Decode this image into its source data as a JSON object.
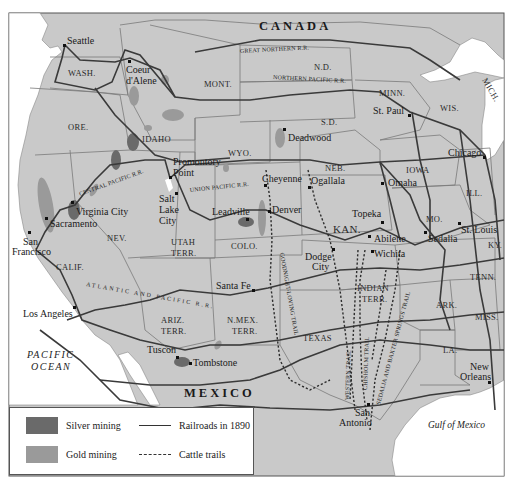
{
  "map": {
    "type": "historical thematic map",
    "subject": "Western United States mining, railroads and cattle trails",
    "colors": {
      "land": "#c9c9c9",
      "water": "#ffffff",
      "border": "#777777",
      "railroad": "#3a3a3a",
      "silver": "#6a6a6a",
      "gold": "#9a9a9a",
      "frame": "#555555"
    },
    "countries": [
      {
        "label": "CANADA"
      },
      {
        "label": "MEXICO"
      }
    ],
    "water_bodies": [
      {
        "label_line1": "PACIFIC",
        "label_line2": "OCEAN"
      },
      {
        "label": "Gulf of Mexico"
      }
    ],
    "states": [
      "WASH.",
      "ORE.",
      "IDAHO",
      "MONT.",
      "WYO.",
      "N.D.",
      "S.D.",
      "NEB.",
      "MINN.",
      "WIS.",
      "MICH.",
      "IOWA",
      "ILL.",
      "MO.",
      "KAN.",
      "KY.",
      "TENN.",
      "ARK.",
      "MISS.",
      "LA.",
      "TEXAS",
      "COLO.",
      "NEV.",
      "CALIF.",
      "ARIZ.",
      "TERR.",
      "N.MEX.",
      "TERR.",
      "UTAH",
      "TERR.",
      "INDIAN",
      "TERR."
    ],
    "cities": [
      "Seattle",
      "Coeur",
      "d'Alene",
      "St. Paul",
      "Deadwood",
      "Chicago",
      "Promontory",
      "Point",
      "Salt",
      "Lake",
      "City",
      "Cheyenne",
      "Ogallala",
      "Omaha",
      "Virginia City",
      "Sacramento",
      "San",
      "Francisco",
      "Leadville",
      "Denver",
      "Topeka",
      "Abilene",
      "St. Louis",
      "Sedalia",
      "Wichita",
      "Dodge",
      "City",
      "Santa Fe",
      "Los Angeles",
      "Tuscon",
      "Tombstone",
      "New",
      "Orleans",
      "San",
      "Antonio"
    ],
    "railroads": [
      "GREAT NORTHERN R.R.",
      "NORTHERN PACIFIC R.R.",
      "CENTRAL PACIFIC R.R.",
      "UNION PACIFIC R.R.",
      "ATLANTIC AND PACIFIC R.R."
    ],
    "trails": [
      "GOODNIGHT-LOVING TRAIL",
      "WESTERN TRAIL",
      "CHISHOLM TRAIL",
      "SEDALIA AND BAXTER SPRINGS TRAIL"
    ]
  },
  "labels": {
    "canada": "CANADA",
    "mexico": "MEXICO",
    "pacific1": "PACIFIC",
    "pacific2": "OCEAN",
    "gulf": "Gulf of Mexico",
    "wash": "WASH.",
    "ore": "ORE.",
    "idaho": "IDAHO",
    "mont": "MONT.",
    "wyo": "WYO.",
    "nd": "N.D.",
    "sd": "S.D.",
    "neb": "NEB.",
    "minn": "MINN.",
    "wis": "WIS.",
    "mich": "MICH.",
    "iowa": "IOWA",
    "ill": "ILL.",
    "mo": "MO.",
    "kan": "KAN.",
    "ky": "KY.",
    "tenn": "TENN.",
    "ark": "ARK.",
    "miss": "MISS.",
    "la": "LA.",
    "texas": "TEXAS",
    "colo": "COLO.",
    "nev": "NEV.",
    "calif": "CALIF.",
    "ariz1": "ARIZ.",
    "ariz2": "TERR.",
    "nmex1": "N.MEX.",
    "nmex2": "TERR.",
    "utah1": "UTAH",
    "utah2": "TERR.",
    "indian1": "INDIAN",
    "indian2": "TERR.",
    "seattle": "Seattle",
    "coeur1": "Coeur",
    "coeur2": "d'Alene",
    "stpaul": "St. Paul",
    "deadwood": "Deadwood",
    "chicago": "Chicago",
    "promontory1": "Promontory",
    "promontory2": "Point",
    "slc1": "Salt",
    "slc2": "Lake",
    "slc3": "City",
    "cheyenne": "Cheyenne",
    "ogallala": "Ogallala",
    "omaha": "Omaha",
    "virginia": "Virginia City",
    "sacramento": "Sacramento",
    "sf1": "San",
    "sf2": "Francisco",
    "leadville": "Leadville",
    "denver": "Denver",
    "topeka": "Topeka",
    "abilene": "Abilene",
    "stlouis": "St. Louis",
    "sedalia": "Sedalia",
    "wichita": "Wichita",
    "dodge1": "Dodge",
    "dodge2": "City",
    "santafe": "Santa Fe",
    "la_city": "Los Angeles",
    "tuscon": "Tuscon",
    "tombstone": "Tombstone",
    "no1": "New",
    "no2": "Orleans",
    "sa1": "San",
    "sa2": "Antonio",
    "rr_gn": "GREAT NORTHERN R.R.",
    "rr_np": "NORTHERN PACIFIC R.R.",
    "rr_cp": "CENTRAL PACIFIC R.R.",
    "rr_up": "UNION PACIFIC R.R.",
    "rr_ap": "ATLANTIC AND PACIFIC R.R.",
    "tr_gl": "GOODNIGHT-LOVING TRAIL",
    "tr_w": "WESTERN TRAIL",
    "tr_c": "CHISHOLM TRAIL",
    "tr_s": "SEDALIA AND BAXTER SPRINGS TRAIL"
  },
  "legend": {
    "items": [
      {
        "label": "Silver mining",
        "kind": "swatch",
        "color": "#6a6a6a"
      },
      {
        "label": "Gold mining",
        "kind": "swatch",
        "color": "#9a9a9a"
      },
      {
        "label": "Railroads in 1890",
        "kind": "solid-line"
      },
      {
        "label": "Cattle trails",
        "kind": "dashed-line"
      }
    ]
  }
}
